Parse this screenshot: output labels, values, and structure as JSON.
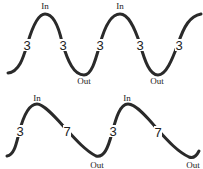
{
  "diagram": {
    "top": {
      "pattern": "3-3 (equal inhale/exhale)",
      "peak_label": "In",
      "trough_label": "Out",
      "peaks": [
        {
          "label": "In",
          "x": 45,
          "y": 8
        },
        {
          "label": "In",
          "x": 120,
          "y": 8
        }
      ],
      "troughs": [
        {
          "label": "Out",
          "x": 84,
          "y": 83
        },
        {
          "label": "Out",
          "x": 157,
          "y": 83
        }
      ],
      "counts": [
        {
          "value": "3",
          "x": 27,
          "y": 49
        },
        {
          "value": "3",
          "x": 63,
          "y": 49
        },
        {
          "value": "3",
          "x": 100,
          "y": 49
        },
        {
          "value": "3",
          "x": 140,
          "y": 49
        },
        {
          "value": "3",
          "x": 179,
          "y": 49
        }
      ]
    },
    "bottom": {
      "pattern": "3-7 (short inhale, long exhale)",
      "peaks": [
        {
          "label": "In",
          "x": 37,
          "y": 101
        },
        {
          "label": "In",
          "x": 127,
          "y": 101
        }
      ],
      "troughs": [
        {
          "label": "Out",
          "x": 97,
          "y": 167
        },
        {
          "label": "Out",
          "x": 193,
          "y": 167
        }
      ],
      "counts": [
        {
          "value": "3",
          "x": 20,
          "y": 135
        },
        {
          "value": "7",
          "x": 67,
          "y": 135
        },
        {
          "value": "3",
          "x": 113,
          "y": 135
        },
        {
          "value": "7",
          "x": 158,
          "y": 136
        }
      ]
    },
    "colors": {
      "stroke": "#2a2a2a",
      "text": "#222222",
      "background": "#ffffff"
    }
  }
}
